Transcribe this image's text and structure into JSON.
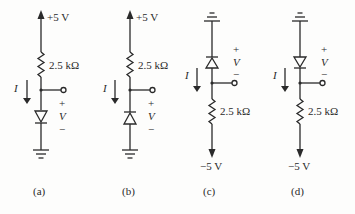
{
  "figure": {
    "circuits": [
      {
        "id": "a",
        "caption": "(a)",
        "supply_label": "+5 V",
        "resistor_label": "2.5 kΩ",
        "current_label": "I",
        "voltage_label": "V",
        "plus": "+",
        "minus": "−",
        "topology": "supply-top, resistor, node, diode (anode up, cathode down), ground"
      },
      {
        "id": "b",
        "caption": "(b)",
        "supply_label": "+5 V",
        "resistor_label": "2.5 kΩ",
        "current_label": "I",
        "voltage_label": "V",
        "plus": "+",
        "minus": "−",
        "topology": "supply-top, resistor, node, diode (cathode up, anode down), ground"
      },
      {
        "id": "c",
        "caption": "(c)",
        "supply_label": "−5 V",
        "resistor_label": "2.5 kΩ",
        "current_label": "I",
        "voltage_label": "V",
        "plus": "+",
        "minus": "−",
        "topology": "ground-top, diode (cathode up, anode down), node, resistor, supply-bottom"
      },
      {
        "id": "d",
        "caption": "(d)",
        "supply_label": "−5 V",
        "resistor_label": "2.5 kΩ",
        "current_label": "I",
        "voltage_label": "V",
        "plus": "+",
        "minus": "−",
        "topology": "ground-top, diode (anode up, cathode down), node, resistor, supply-bottom"
      }
    ],
    "colors": {
      "ink": "#2a2a2a",
      "background": "#fdfdfc"
    }
  }
}
